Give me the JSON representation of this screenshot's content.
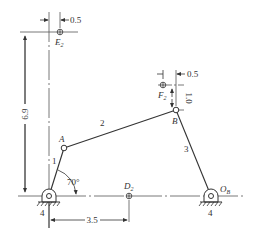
{
  "diagram": {
    "colors": {
      "line": "#333333",
      "centerline": "#555555",
      "background": "#ffffff"
    },
    "links": [
      {
        "id": "1",
        "label": "1",
        "from": "O_A",
        "to": "A"
      },
      {
        "id": "2",
        "label": "2",
        "from": "A",
        "to": "B"
      },
      {
        "id": "3",
        "label": "3",
        "from": "B",
        "to": "O_B"
      },
      {
        "id": "4",
        "label": "4",
        "type": "ground"
      }
    ],
    "joints": {
      "A": {
        "label": "A"
      },
      "B": {
        "label": "B"
      },
      "O_B": {
        "label": "O",
        "sub": "B"
      }
    },
    "points": {
      "E2": {
        "label": "E",
        "sub": "2"
      },
      "F2": {
        "label": "F",
        "sub": "2"
      },
      "D2": {
        "label": "D",
        "sub": "2"
      }
    },
    "ground_labels": {
      "left": "4",
      "right": "4"
    },
    "dimensions": {
      "e2_offset": "0.5",
      "f2_offset": "0.5",
      "f2_height": "1.0",
      "e2_height": "6.9",
      "d2_distance": "3.5",
      "crank_angle": "70°"
    }
  }
}
